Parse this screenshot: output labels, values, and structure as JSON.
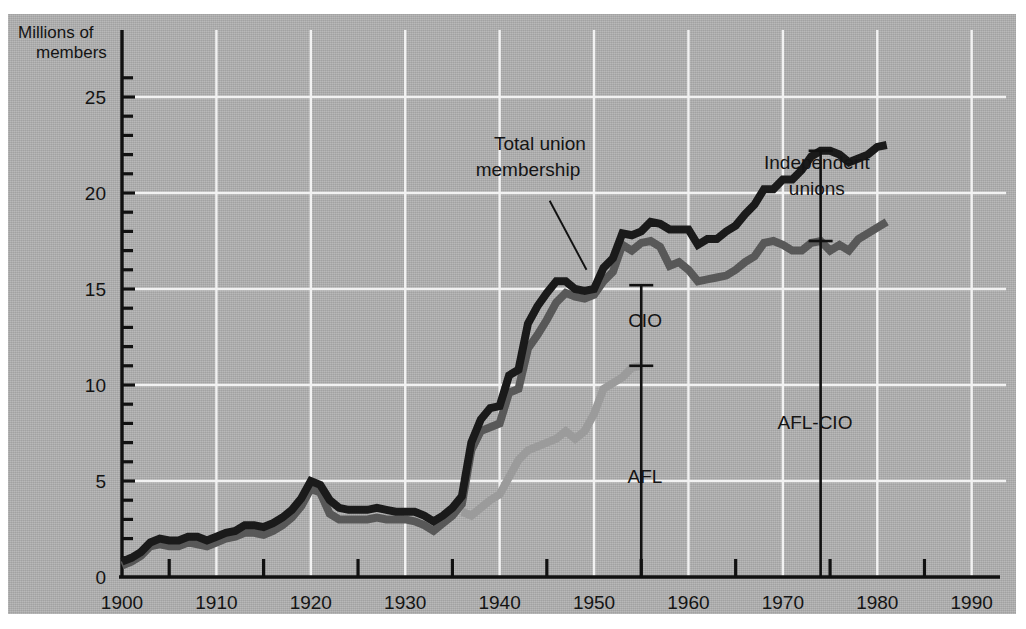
{
  "chart_data": {
    "type": "line",
    "title": "",
    "subtitle": "",
    "xlabel": "",
    "ylabel": "Millions of members",
    "ylabel_line1": "Millions of",
    "ylabel_line2": "members",
    "xlim": [
      1900,
      1993
    ],
    "ylim": [
      0,
      26.5
    ],
    "xticks": [
      1900,
      1910,
      1920,
      1930,
      1940,
      1950,
      1960,
      1970,
      1980,
      1990
    ],
    "xtick_labels": [
      "1900",
      "1910",
      "1920",
      "1930",
      "1940",
      "1950",
      "1960",
      "1970",
      "1980",
      "1990"
    ],
    "xminor_ticks": [
      1905,
      1915,
      1925,
      1935,
      1945,
      1955,
      1965,
      1975,
      1985
    ],
    "yticks": [
      0,
      5,
      10,
      15,
      20,
      25
    ],
    "ytick_labels": [
      "0",
      "5",
      "10",
      "15",
      "20",
      "25"
    ],
    "yminor_ticks": [
      1,
      2,
      3,
      4,
      6,
      7,
      8,
      9,
      11,
      12,
      13,
      14,
      16,
      17,
      18,
      19,
      21,
      22,
      23,
      24,
      26
    ],
    "grid": {
      "x": true,
      "y": true,
      "color": "#f2f2f2"
    },
    "legend_position": "none",
    "colors": {
      "total_union": "#1a1a1a",
      "afl_cio_combined": "#585858",
      "afl": "#9b9b9b",
      "panel_background": "#b2b2b2",
      "gridline": "#f2f2f2",
      "axis": "#111111",
      "page_background": "#ffffff"
    },
    "series": [
      {
        "name": "Total union membership",
        "color": "#1a1a1a",
        "x": [
          1900,
          1901,
          1902,
          1903,
          1904,
          1905,
          1906,
          1907,
          1908,
          1909,
          1910,
          1911,
          1912,
          1913,
          1914,
          1915,
          1916,
          1917,
          1918,
          1919,
          1920,
          1921,
          1922,
          1923,
          1924,
          1925,
          1926,
          1927,
          1928,
          1929,
          1930,
          1931,
          1932,
          1933,
          1934,
          1935,
          1936,
          1937,
          1938,
          1939,
          1940,
          1941,
          1942,
          1943,
          1944,
          1945,
          1946,
          1947,
          1948,
          1949,
          1950,
          1951,
          1952,
          1953,
          1954,
          1955,
          1956,
          1957,
          1958,
          1959,
          1960,
          1961,
          1962,
          1963,
          1964,
          1965,
          1966,
          1967,
          1968,
          1969,
          1970,
          1971,
          1972,
          1973,
          1974,
          1975,
          1976,
          1977,
          1978,
          1979,
          1980,
          1981
        ],
        "y": [
          0.8,
          1.0,
          1.3,
          1.8,
          2.0,
          1.9,
          1.9,
          2.1,
          2.1,
          1.9,
          2.1,
          2.3,
          2.4,
          2.7,
          2.7,
          2.6,
          2.8,
          3.1,
          3.5,
          4.1,
          5.0,
          4.8,
          4.0,
          3.6,
          3.5,
          3.5,
          3.5,
          3.6,
          3.5,
          3.4,
          3.4,
          3.4,
          3.2,
          2.9,
          3.2,
          3.6,
          4.2,
          7.0,
          8.2,
          8.8,
          8.9,
          10.5,
          10.8,
          13.2,
          14.1,
          14.8,
          15.4,
          15.4,
          15.0,
          14.9,
          15.0,
          16.1,
          16.6,
          17.9,
          17.8,
          18.0,
          18.5,
          18.4,
          18.1,
          18.1,
          18.1,
          17.3,
          17.6,
          17.6,
          18.0,
          18.3,
          18.9,
          19.4,
          20.2,
          20.2,
          20.7,
          20.7,
          21.2,
          21.9,
          22.2,
          22.2,
          22.0,
          21.6,
          21.8,
          22.0,
          22.4,
          22.5
        ]
      },
      {
        "name": "AFL-CIO",
        "color": "#585858",
        "x": [
          1900,
          1901,
          1902,
          1903,
          1904,
          1905,
          1906,
          1907,
          1908,
          1909,
          1910,
          1911,
          1912,
          1913,
          1914,
          1915,
          1916,
          1917,
          1918,
          1919,
          1920,
          1921,
          1922,
          1923,
          1924,
          1925,
          1926,
          1927,
          1928,
          1929,
          1930,
          1931,
          1932,
          1933,
          1934,
          1935,
          1936,
          1937,
          1938,
          1939,
          1940,
          1941,
          1942,
          1943,
          1944,
          1945,
          1946,
          1947,
          1948,
          1949,
          1950,
          1951,
          1952,
          1953,
          1954,
          1955,
          1956,
          1957,
          1958,
          1959,
          1960,
          1961,
          1962,
          1963,
          1964,
          1965,
          1966,
          1967,
          1968,
          1969,
          1970,
          1971,
          1972,
          1973,
          1974,
          1975,
          1976,
          1977,
          1978,
          1979,
          1980,
          1981
        ],
        "y": [
          0.6,
          0.8,
          1.1,
          1.6,
          1.7,
          1.6,
          1.6,
          1.8,
          1.7,
          1.6,
          1.8,
          2.0,
          2.1,
          2.3,
          2.3,
          2.2,
          2.4,
          2.7,
          3.1,
          3.7,
          4.6,
          4.4,
          3.3,
          3.0,
          3.0,
          3.0,
          3.0,
          3.1,
          3.0,
          3.0,
          3.0,
          2.9,
          2.7,
          2.4,
          2.8,
          3.2,
          3.8,
          6.6,
          7.6,
          7.8,
          8.0,
          9.6,
          9.8,
          11.9,
          12.6,
          13.4,
          14.3,
          14.8,
          14.6,
          14.5,
          14.7,
          15.4,
          15.9,
          17.3,
          17.0,
          17.4,
          17.5,
          17.2,
          16.2,
          16.4,
          16.0,
          15.4,
          15.5,
          15.6,
          15.7,
          16.0,
          16.4,
          16.7,
          17.4,
          17.5,
          17.3,
          17.0,
          17.0,
          17.4,
          17.5,
          17.0,
          17.3,
          17.0,
          17.6,
          17.9,
          18.2,
          18.5
        ]
      },
      {
        "name": "AFL",
        "color": "#9b9b9b",
        "x": [
          1936,
          1937,
          1938,
          1939,
          1940,
          1941,
          1942,
          1943,
          1944,
          1945,
          1946,
          1947,
          1948,
          1949,
          1950,
          1951,
          1952,
          1953,
          1954,
          1955
        ],
        "y": [
          3.4,
          3.2,
          3.6,
          4.0,
          4.3,
          5.2,
          6.1,
          6.6,
          6.8,
          7.0,
          7.2,
          7.6,
          7.2,
          7.6,
          8.5,
          9.8,
          10.1,
          10.4,
          10.9,
          11.0
        ]
      }
    ],
    "annotations": [
      {
        "name": "total-union-membership",
        "text_line1": "Total union",
        "text_line2": "membership",
        "label_x": 1943.0,
        "label_y": 20.9,
        "leader_from_x": 1945.3,
        "leader_from_y": 19.6,
        "leader_to_x": 1949.2,
        "leader_to_y": 16.0
      },
      {
        "name": "cio-bracket-label",
        "text": "CIO",
        "label_x": 1955.4,
        "label_y": 13.0
      },
      {
        "name": "afl-bracket-label",
        "text": "AFL",
        "label_x": 1955.4,
        "label_y": 4.9
      },
      {
        "name": "independent-unions-label",
        "text_line1": "Independent",
        "text_line2": "unions",
        "label_x": 1973.6,
        "label_y": 19.9
      },
      {
        "name": "afl-cio-bracket-label",
        "text": "AFL-CIO",
        "label_x": 1973.4,
        "label_y": 7.7
      }
    ],
    "measure_bars": [
      {
        "name": "1955-afl-cio-split",
        "x": 1955,
        "y_bottom": 0,
        "y_top": 15.2,
        "crossbar_y": 11.0,
        "top_cap": true,
        "segments": [
          {
            "label": "AFL",
            "from": 0,
            "to": 11.0
          },
          {
            "label": "CIO",
            "from": 11.0,
            "to": 15.2
          }
        ]
      },
      {
        "name": "1974-independent-split",
        "x": 1974,
        "y_bottom": 0,
        "y_top": 22.2,
        "crossbar_y": 17.5,
        "top_cap": true,
        "segments": [
          {
            "label": "AFL-CIO",
            "from": 0,
            "to": 17.5
          },
          {
            "label": "Independent unions",
            "from": 17.5,
            "to": 22.2
          }
        ]
      }
    ]
  }
}
